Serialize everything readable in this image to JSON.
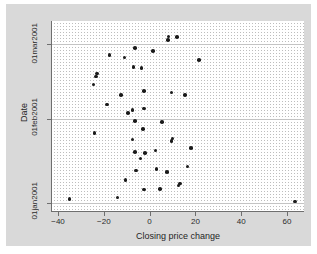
{
  "chart_data": {
    "type": "scatter",
    "title": "",
    "xlabel": "Closing price change",
    "ylabel": "Date",
    "xlim": [
      -46,
      70
    ],
    "ylim_labels": [
      "01jan2001",
      "01mar2001"
    ],
    "grid": "dotted",
    "legend": "none",
    "marker_color": "#1a1a1a",
    "x_ticks": [
      {
        "value": -40,
        "label": "−40"
      },
      {
        "value": -20,
        "label": "−20"
      },
      {
        "value": 0,
        "label": "0"
      },
      {
        "value": 20,
        "label": "20"
      },
      {
        "value": 40,
        "label": "40"
      },
      {
        "value": 60,
        "label": "60"
      }
    ],
    "y_ticks": [
      {
        "value": 0,
        "label": "01jan2001"
      },
      {
        "value": 31,
        "label": "01feb2001"
      },
      {
        "value": 59,
        "label": "01mar2001"
      }
    ],
    "y_gridlines": [
      0,
      31,
      59
    ],
    "points": [
      {
        "x": -35.0,
        "y": 1.5
      },
      {
        "x": 63.5,
        "y": 0.5
      },
      {
        "x": -14.0,
        "y": 2.0
      },
      {
        "x": 12.6,
        "y": 6.5
      },
      {
        "x": 13.3,
        "y": 7.3
      },
      {
        "x": -2.5,
        "y": 5.0
      },
      {
        "x": 4.5,
        "y": 5.3
      },
      {
        "x": -10.5,
        "y": 8.5
      },
      {
        "x": -6.0,
        "y": 12.0
      },
      {
        "x": 3.0,
        "y": 12.7
      },
      {
        "x": 7.5,
        "y": 11.5
      },
      {
        "x": 16.5,
        "y": 13.5
      },
      {
        "x": -4.0,
        "y": 16.5
      },
      {
        "x": -2.0,
        "y": 18.5
      },
      {
        "x": -6.5,
        "y": 19.0
      },
      {
        "x": 2.5,
        "y": 19.5
      },
      {
        "x": 18.0,
        "y": 20.5
      },
      {
        "x": -7.5,
        "y": 23.5
      },
      {
        "x": 9.5,
        "y": 23.0
      },
      {
        "x": 10.0,
        "y": 24.0
      },
      {
        "x": -24.0,
        "y": 26.0
      },
      {
        "x": -3.0,
        "y": 27.5
      },
      {
        "x": -6.5,
        "y": 30.5
      },
      {
        "x": 5.5,
        "y": 30.0
      },
      {
        "x": -9.5,
        "y": 33.5
      },
      {
        "x": -7.5,
        "y": 34.5
      },
      {
        "x": -2.5,
        "y": 35.0
      },
      {
        "x": -18.5,
        "y": 36.5
      },
      {
        "x": -12.5,
        "y": 40.0
      },
      {
        "x": -2.5,
        "y": 41.5
      },
      {
        "x": 9.5,
        "y": 41.0
      },
      {
        "x": 15.5,
        "y": 40.0
      },
      {
        "x": -24.5,
        "y": 44.0
      },
      {
        "x": -23.5,
        "y": 47.0
      },
      {
        "x": -23.0,
        "y": 48.0
      },
      {
        "x": -3.5,
        "y": 50.0
      },
      {
        "x": -7.0,
        "y": 50.5
      },
      {
        "x": 21.5,
        "y": 53.0
      },
      {
        "x": -17.5,
        "y": 55.0
      },
      {
        "x": -11.0,
        "y": 54.0
      },
      {
        "x": -6.5,
        "y": 57.5
      },
      {
        "x": 1.5,
        "y": 56.5
      },
      {
        "x": 8.0,
        "y": 60.5
      },
      {
        "x": 8.2,
        "y": 61.8
      },
      {
        "x": 12.0,
        "y": 61.5
      }
    ]
  }
}
